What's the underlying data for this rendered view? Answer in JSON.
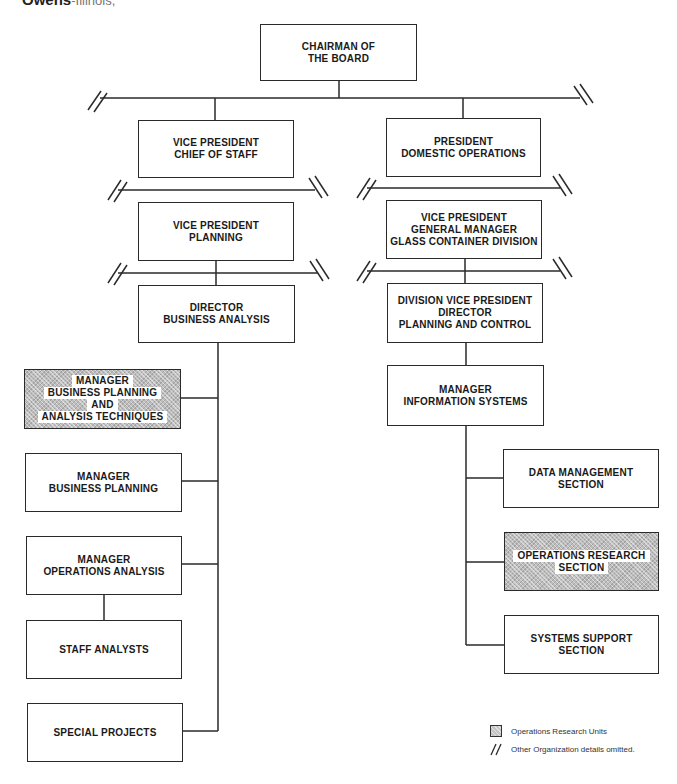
{
  "header": {
    "title_bold": "Owens",
    "title_rest": "-Illinois,"
  },
  "chart": {
    "root": {
      "label_lines": [
        "CHAIRMAN OF",
        "THE BOARD"
      ]
    },
    "left_branch": [
      {
        "id": "vp-chief-of-staff",
        "label_lines": [
          "VICE PRESIDENT",
          "CHIEF OF STAFF"
        ]
      },
      {
        "id": "vp-planning",
        "label_lines": [
          "VICE PRESIDENT",
          "PLANNING"
        ]
      },
      {
        "id": "director-business-analysis",
        "label_lines": [
          "DIRECTOR",
          "BUSINESS ANALYSIS"
        ]
      }
    ],
    "left_children": [
      {
        "id": "mgr-bp-at",
        "label_lines": [
          "MANAGER",
          "BUSINESS PLANNING",
          "AND",
          "ANALYSIS TECHNIQUES"
        ],
        "operations_research": true
      },
      {
        "id": "mgr-business-planning",
        "label_lines": [
          "MANAGER",
          "BUSINESS PLANNING"
        ],
        "operations_research": false
      },
      {
        "id": "mgr-operations-analysis",
        "label_lines": [
          "MANAGER",
          "OPERATIONS ANALYSIS"
        ],
        "operations_research": false
      },
      {
        "id": "staff-analysts",
        "label_lines": [
          "STAFF ANALYSTS"
        ],
        "operations_research": false
      },
      {
        "id": "special-projects",
        "label_lines": [
          "SPECIAL PROJECTS"
        ],
        "operations_research": false
      }
    ],
    "right_branch": [
      {
        "id": "president-domestic-operations",
        "label_lines": [
          "PRESIDENT",
          "DOMESTIC OPERATIONS"
        ]
      },
      {
        "id": "vp-gm-glass-container",
        "label_lines": [
          "VICE PRESIDENT",
          "GENERAL MANAGER",
          "GLASS CONTAINER DIVISION"
        ]
      },
      {
        "id": "division-vp-planning-control",
        "label_lines": [
          "DIVISION VICE PRESIDENT",
          "DIRECTOR",
          "PLANNING AND CONTROL"
        ]
      },
      {
        "id": "mgr-information-systems",
        "label_lines": [
          "MANAGER",
          "INFORMATION SYSTEMS"
        ]
      }
    ],
    "right_children": [
      {
        "id": "data-management-section",
        "label_lines": [
          "DATA MANAGEMENT",
          "SECTION"
        ],
        "operations_research": false
      },
      {
        "id": "operations-research-section",
        "label_lines": [
          "OPERATIONS RESEARCH",
          "SECTION"
        ],
        "operations_research": true
      },
      {
        "id": "systems-support-section",
        "label_lines": [
          "SYSTEMS SUPPORT",
          "SECTION"
        ],
        "operations_research": false
      }
    ]
  },
  "legend": {
    "items": [
      {
        "symbol": "hatched-square-icon",
        "label": "Operations Research Units"
      },
      {
        "symbol": "double-slash-icon",
        "label": "Other Organization details omitted."
      }
    ]
  },
  "colors": {
    "line": "#2a2a2a",
    "hatch_fill": "#bdbdbd",
    "background": "#ffffff"
  }
}
